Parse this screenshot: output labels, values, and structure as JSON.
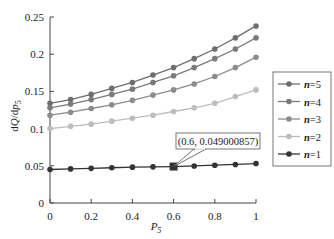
{
  "chart_data": {
    "type": "line",
    "title": "",
    "xlabel": "P5",
    "ylabel": "dQ/dp5",
    "xlim": [
      0,
      1
    ],
    "ylim": [
      0,
      0.25
    ],
    "x_ticks": [
      "0",
      "0.2",
      "0.4",
      "0.6",
      "0.8",
      "1"
    ],
    "y_ticks": [
      "0",
      "0.05",
      "0.1",
      "0.15",
      "0.2",
      "0.25"
    ],
    "grid": false,
    "legend_position": "right",
    "x": [
      0,
      0.1,
      0.2,
      0.3,
      0.4,
      0.5,
      0.6,
      0.7,
      0.8,
      0.9,
      1.0
    ],
    "series": [
      {
        "name": "n=5",
        "color": "#6e6e6e",
        "values": [
          0.134,
          0.139,
          0.146,
          0.154,
          0.162,
          0.172,
          0.182,
          0.194,
          0.207,
          0.222,
          0.238
        ]
      },
      {
        "name": "n=4",
        "color": "#7a7a7a",
        "values": [
          0.128,
          0.133,
          0.139,
          0.146,
          0.153,
          0.162,
          0.171,
          0.182,
          0.194,
          0.207,
          0.222
        ]
      },
      {
        "name": "n=3",
        "color": "#8c8c8c",
        "values": [
          0.118,
          0.122,
          0.127,
          0.132,
          0.138,
          0.145,
          0.152,
          0.16,
          0.17,
          0.182,
          0.196
        ]
      },
      {
        "name": "n=2",
        "color": "#bdbdbd",
        "values": [
          0.1,
          0.103,
          0.106,
          0.11,
          0.114,
          0.118,
          0.123,
          0.128,
          0.134,
          0.143,
          0.152
        ]
      },
      {
        "name": "n=1",
        "color": "#333333",
        "values": [
          0.045,
          0.0458,
          0.0466,
          0.0474,
          0.0482,
          0.0486,
          0.049000857,
          0.0498,
          0.0508,
          0.0518,
          0.053
        ]
      }
    ],
    "annotations": [
      {
        "text": "(0.6, 0.049000857)",
        "x": 0.6,
        "y": 0.049000857,
        "series": "n=1",
        "marker": "square"
      }
    ]
  }
}
